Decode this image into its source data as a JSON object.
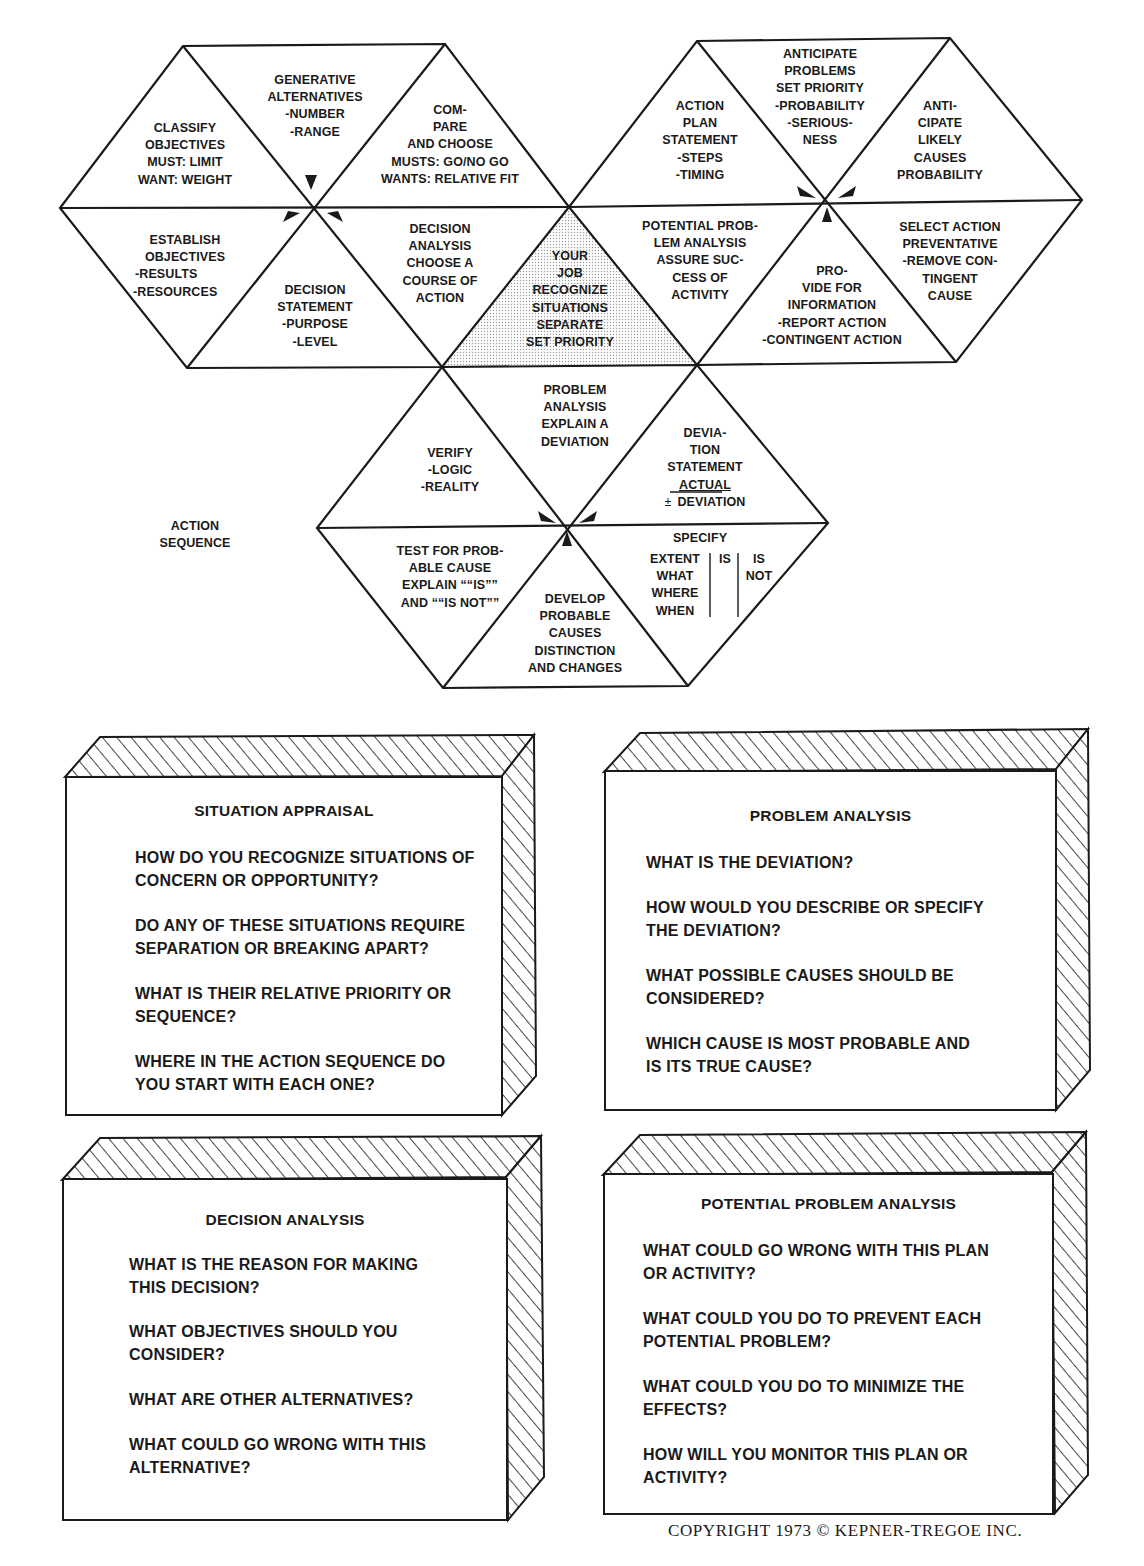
{
  "diagram": {
    "label": "ACTION SEQUENCE",
    "center": {
      "lines": [
        "YOUR",
        "JOB",
        "RECOGNIZE",
        "SITUATIONS",
        "SEPARATE",
        "SET PRIORITY"
      ]
    },
    "decision_hex": {
      "title": [
        "DECISION",
        "ANALYSIS",
        "CHOOSE A",
        "COURSE OF",
        "ACTION"
      ],
      "decision_statement": [
        "DECISION",
        "STATEMENT",
        "-PURPOSE",
        "-LEVEL"
      ],
      "establish_objectives": [
        "ESTABLISH",
        "OBJECTIVES",
        "-RESULTS",
        "-RESOURCES"
      ],
      "classify_objectives": [
        "CLASSIFY",
        "OBJECTIVES",
        "MUST: LIMIT",
        "WANT: WEIGHT"
      ],
      "generate_alternatives": [
        "GENERATIVE",
        "ALTERNATIVES",
        "-NUMBER",
        "-RANGE"
      ],
      "compare_choose": [
        "COM-",
        "PARE",
        "AND CHOOSE",
        "MUSTS: GO/NO GO",
        "WANTS: RELATIVE FIT"
      ]
    },
    "ppa_hex": {
      "title": [
        "POTENTIAL PROB-",
        "LEM ANALYSIS",
        "ASSURE SUC-",
        "CESS OF",
        "ACTIVITY"
      ],
      "action_plan": [
        "ACTION",
        "PLAN",
        "STATEMENT",
        "-STEPS",
        "-TIMING"
      ],
      "anticipate_problems": [
        "ANTICIPATE",
        "PROBLEMS",
        "SET PRIORITY",
        "-PROBABILITY",
        "-SERIOUS-",
        "NESS"
      ],
      "anticipate_causes": [
        "ANTI-",
        "CIPATE",
        "LIKELY",
        "CAUSES",
        "PROBABILITY"
      ],
      "select_action": [
        "SELECT ACTION",
        "PREVENTATIVE",
        "-REMOVE CON-",
        "TINGENT",
        "CAUSE"
      ],
      "provide_info": [
        "PRO-",
        "VIDE FOR",
        "INFORMATION",
        "-REPORT ACTION",
        "-CONTINGENT ACTION"
      ]
    },
    "pa_hex": {
      "title": [
        "PROBLEM",
        "ANALYSIS",
        "EXPLAIN A",
        "DEVIATION"
      ],
      "deviation_statement": [
        "DEVIA-",
        "TION",
        "STATEMENT"
      ],
      "deviation_actual": "ACTUAL",
      "deviation_pm": "±",
      "deviation_deviation": "DEVIATION",
      "specify_title": "SPECIFY",
      "specify_rows": [
        "EXTENT",
        "WHAT",
        "WHERE",
        "WHEN"
      ],
      "specify_is": "IS",
      "specify_is_not": [
        "IS",
        "NOT"
      ],
      "develop_causes": [
        "DEVELOP",
        "PROBABLE",
        "CAUSES",
        "DISTINCTION",
        "AND CHANGES"
      ],
      "test_cause": [
        "TEST FOR PROB-",
        "ABLE CAUSE",
        "EXPLAIN ““IS””",
        "AND ““IS NOT””"
      ],
      "verify": [
        "VERIFY",
        "-LOGIC",
        "-REALITY"
      ]
    }
  },
  "boxes": [
    {
      "title": "SITUATION APPRAISAL",
      "questions": [
        [
          "HOW DO YOU RECOGNIZE SITUATIONS OF",
          "CONCERN OR OPPORTUNITY?"
        ],
        [
          "DO ANY OF THESE SITUATIONS REQUIRE",
          "SEPARATION OR BREAKING APART?"
        ],
        [
          "WHAT IS THEIR RELATIVE PRIORITY OR",
          "SEQUENCE?"
        ],
        [
          "WHERE IN THE ACTION SEQUENCE DO",
          "YOU START WITH EACH ONE?"
        ]
      ]
    },
    {
      "title": "PROBLEM ANALYSIS",
      "questions": [
        [
          "WHAT IS THE DEVIATION?"
        ],
        [
          "HOW WOULD YOU DESCRIBE OR SPECIFY",
          "THE DEVIATION?"
        ],
        [
          "WHAT POSSIBLE CAUSES SHOULD BE",
          "CONSIDERED?"
        ],
        [
          "WHICH CAUSE IS MOST PROBABLE AND",
          "IS ITS TRUE CAUSE?"
        ]
      ]
    },
    {
      "title": "DECISION ANALYSIS",
      "questions": [
        [
          "WHAT IS THE REASON FOR MAKING",
          "THIS DECISION?"
        ],
        [
          "WHAT OBJECTIVES SHOULD YOU",
          "CONSIDER?"
        ],
        [
          "WHAT ARE OTHER ALTERNATIVES?"
        ],
        [
          "WHAT COULD GO WRONG WITH THIS",
          "ALTERNATIVE?"
        ]
      ]
    },
    {
      "title": "POTENTIAL PROBLEM ANALYSIS",
      "questions": [
        [
          "WHAT COULD GO WRONG WITH THIS PLAN",
          "OR ACTIVITY?"
        ],
        [
          "WHAT COULD YOU DO TO PREVENT EACH",
          "POTENTIAL PROBLEM?"
        ],
        [
          "WHAT COULD YOU DO TO MINIMIZE THE",
          "EFFECTS?"
        ],
        [
          "HOW WILL YOU MONITOR THIS PLAN OR",
          "ACTIVITY?"
        ]
      ]
    }
  ],
  "copyright": "COPYRIGHT 1973 © KEPNER-TREGOE INC.",
  "colors": {
    "ink": "#1a1a1a",
    "paper": "#ffffff",
    "center_shade": "#e4e4e4"
  }
}
